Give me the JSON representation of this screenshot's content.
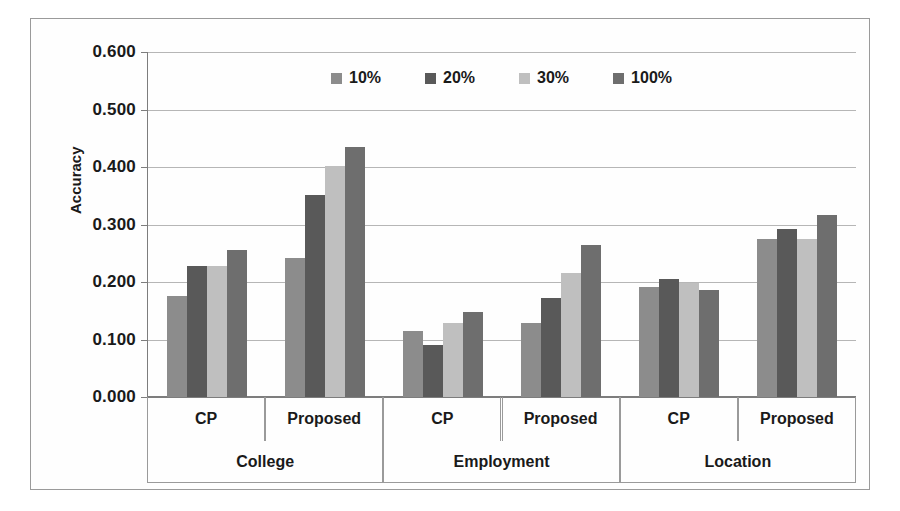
{
  "chart_data": {
    "type": "bar",
    "title": "",
    "xlabel": "",
    "ylabel": "Accuracy",
    "ylim": [
      0.0,
      0.6
    ],
    "ytick_step": 0.1,
    "ytick_labels": [
      "0.600",
      "0.500",
      "0.400",
      "0.300",
      "0.200",
      "0.100",
      "0.000"
    ],
    "ytick_values": [
      0.6,
      0.5,
      0.4,
      0.3,
      0.2,
      0.1,
      0.0
    ],
    "grid": true,
    "legend_position": "top-center",
    "legend_entries": [
      "10%",
      "20%",
      "30%",
      "100%"
    ],
    "categories": [
      "College / CP",
      "College / Proposed",
      "Employment / CP",
      "Employment / Proposed",
      "Location / CP",
      "Location / Proposed"
    ],
    "groups": [
      {
        "group": "College",
        "methods": [
          "CP",
          "Proposed"
        ]
      },
      {
        "group": "Employment",
        "methods": [
          "CP",
          "Proposed"
        ]
      },
      {
        "group": "Location",
        "methods": [
          "CP",
          "Proposed"
        ]
      }
    ],
    "series": [
      {
        "name": "10%",
        "color": "#8c8c8c",
        "values": [
          0.175,
          0.242,
          0.115,
          0.129,
          0.191,
          0.275
        ]
      },
      {
        "name": "20%",
        "color": "#595959",
        "values": [
          0.228,
          0.352,
          0.091,
          0.172,
          0.206,
          0.293
        ]
      },
      {
        "name": "30%",
        "color": "#bfbfbf",
        "values": [
          0.228,
          0.401,
          0.129,
          0.215,
          0.199,
          0.275
        ]
      },
      {
        "name": "100%",
        "color": "#6e6e6e",
        "values": [
          0.255,
          0.435,
          0.148,
          0.264,
          0.186,
          0.317
        ]
      }
    ]
  },
  "axis": {
    "y_title": "Accuracy",
    "sub_labels": [
      "CP",
      "Proposed",
      "CP",
      "Proposed",
      "CP",
      "Proposed"
    ],
    "main_labels": [
      "College",
      "Employment",
      "Location"
    ]
  },
  "colors": {
    "frame": "#9a9a9a",
    "gridline": "#b6b6b6",
    "axis": "#7d7d7d",
    "background": "#ffffff"
  }
}
